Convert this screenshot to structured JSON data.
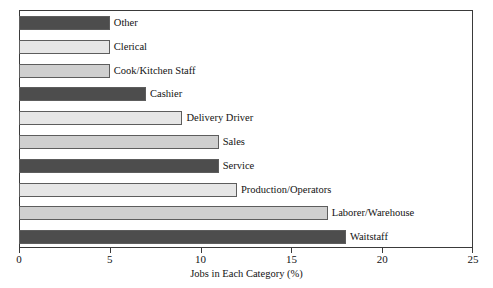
{
  "chart_data": {
    "type": "bar",
    "orientation": "horizontal",
    "title": "",
    "xlabel": "Jobs in Each Category (%)",
    "ylabel": "",
    "xlim": [
      0,
      25
    ],
    "xticks": [
      0,
      5,
      10,
      15,
      20,
      25
    ],
    "xtick_labels": [
      "0",
      "5",
      "10",
      "15",
      "20",
      "25"
    ],
    "grid": false,
    "legend": "none",
    "categories": [
      "Other",
      "Clerical",
      "Cook/Kitchen Staff",
      "Cashier",
      "Delivery Driver",
      "Sales",
      "Service",
      "Production/Operators",
      "Laborer/Warehouse",
      "Waitstaff"
    ],
    "values": [
      5,
      5,
      5,
      7,
      9,
      11,
      11,
      12,
      17,
      18
    ],
    "bar_colors": [
      "#4d4d4d",
      "#e6e6e6",
      "#cfcfcf",
      "#4d4d4d",
      "#e6e6e6",
      "#cfcfcf",
      "#4d4d4d",
      "#e6e6e6",
      "#cfcfcf",
      "#4d4d4d"
    ],
    "bar_edge_color": "#5d5d5d",
    "axis_color": "#3a3a3a",
    "text_color": "#121212",
    "background": "#ffffff"
  }
}
